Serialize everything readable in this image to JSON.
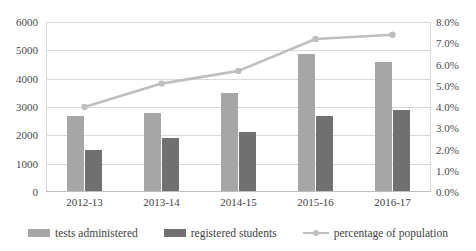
{
  "chart_data": {
    "type": "bar",
    "title": "",
    "xlabel": "",
    "ylabel": "",
    "categories": [
      "2012-13",
      "2013-14",
      "2014-15",
      "2015-16",
      "2016-17"
    ],
    "series": [
      {
        "name": "tests administered",
        "type": "bar",
        "axis": "left",
        "color": "#a6a6a6",
        "values": [
          2680,
          2800,
          3500,
          4880,
          4600
        ]
      },
      {
        "name": "registered students",
        "type": "bar",
        "axis": "left",
        "color": "#707070",
        "values": [
          1500,
          1900,
          2120,
          2680,
          2880
        ]
      },
      {
        "name": "percentage of population",
        "type": "line",
        "axis": "right",
        "color": "#bfbfbf",
        "values": [
          4.0,
          5.1,
          5.7,
          7.2,
          7.4
        ]
      }
    ],
    "y_axis_left": {
      "min": 0,
      "max": 6000,
      "ticks": [
        "0",
        "1000",
        "2000",
        "3000",
        "4000",
        "5000",
        "6000"
      ],
      "tick_values": [
        0,
        1000,
        2000,
        3000,
        4000,
        5000,
        6000
      ]
    },
    "y_axis_right": {
      "min": 0,
      "max": 8,
      "ticks": [
        "0.0%",
        "1.0%",
        "2.0%",
        "3.0%",
        "4.0%",
        "5.0%",
        "6.0%",
        "7.0%",
        "8.0%"
      ],
      "tick_values": [
        0,
        1,
        2,
        3,
        4,
        5,
        6,
        7,
        8
      ]
    },
    "grid": true,
    "legend_position": "bottom"
  },
  "legend": {
    "items": [
      {
        "label": "tests administered",
        "marker": "square-swatch"
      },
      {
        "label": "registered students",
        "marker": "square-swatch"
      },
      {
        "label": "percentage of population",
        "marker": "line-with-dot"
      }
    ]
  }
}
